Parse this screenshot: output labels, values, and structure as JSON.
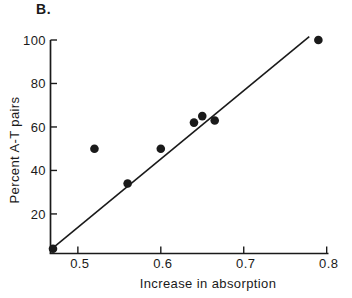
{
  "figure": {
    "panel_label": "B.",
    "background": "#ffffff",
    "ink": "#1a1a1a"
  },
  "chart_data": {
    "type": "scatter",
    "title": "B.",
    "xlabel": "Increase in absorption",
    "ylabel": "Percent A-T pairs",
    "xlim": [
      0.467,
      0.801
    ],
    "ylim": [
      1.8,
      100
    ],
    "xtick_labels": [
      "0.5",
      "0.6",
      "0.7",
      "0.8"
    ],
    "xtick_values": [
      0.5,
      0.6,
      0.7,
      0.8
    ],
    "ytick_labels": [
      "20",
      "40",
      "60",
      "80",
      "100"
    ],
    "ytick_values": [
      20,
      40,
      60,
      80,
      100
    ],
    "grid": false,
    "legend": null,
    "marker_shape": "filled-circle",
    "points": [
      {
        "x": 0.47,
        "y": 4
      },
      {
        "x": 0.52,
        "y": 50
      },
      {
        "x": 0.56,
        "y": 34
      },
      {
        "x": 0.6,
        "y": 50
      },
      {
        "x": 0.64,
        "y": 62
      },
      {
        "x": 0.65,
        "y": 65
      },
      {
        "x": 0.665,
        "y": 63
      },
      {
        "x": 0.79,
        "y": 100
      }
    ],
    "fit_line": {
      "x1": 0.47,
      "y1": 4.4,
      "x2": 0.779,
      "y2": 101.5
    }
  }
}
